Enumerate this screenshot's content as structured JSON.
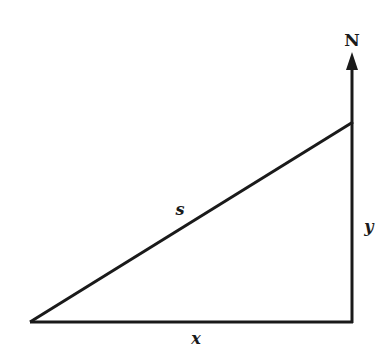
{
  "diagram": {
    "type": "right-triangle",
    "labels": {
      "north": "N",
      "hypotenuse": "s",
      "vertical_leg": "y",
      "horizontal_leg": "x"
    },
    "colors": {
      "stroke": "#1a1a1a",
      "background": "#ffffff"
    }
  }
}
